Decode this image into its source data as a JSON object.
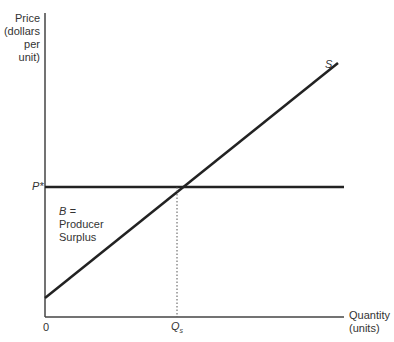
{
  "y_axis": {
    "label_lines": [
      "Price",
      "(dollars",
      "per unit)"
    ]
  },
  "x_axis": {
    "label_lines": [
      "Quantity",
      "(units)"
    ],
    "origin_label": "0"
  },
  "supply_curve": {
    "label": "S"
  },
  "price_level": {
    "label": "P*"
  },
  "quantity_level": {
    "label": "Q",
    "subscript": "s"
  },
  "area_label": {
    "lines": [
      "B =",
      "Producer",
      "Surplus"
    ]
  },
  "colors": {
    "line": "#222222",
    "text": "#333333",
    "background": "#ffffff"
  }
}
